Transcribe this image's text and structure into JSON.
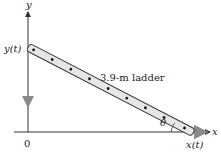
{
  "diagram": {
    "type": "ladder-related-rates",
    "labels": {
      "y_axis": "y",
      "x_axis": "x",
      "origin": "0",
      "y_of_t": "y(t)",
      "x_of_t": "x(t)",
      "ladder": "3.9-m ladder",
      "angle": "θ"
    },
    "ladder_length_m": 3.9,
    "colors": {
      "axis": "#333333",
      "ladder_fill": "#e6e6e6",
      "ladder_stroke": "#333333",
      "dot": "#111111",
      "motion_arrow": "#9a9a9a"
    }
  }
}
